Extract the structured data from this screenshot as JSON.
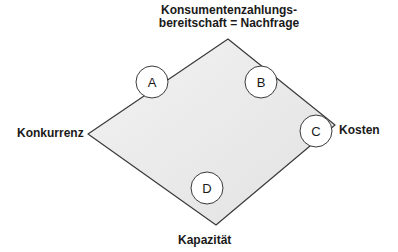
{
  "diagram": {
    "top_label_line1": "Konsumentenzahlungs-",
    "top_label_line2": "bereitschaft = Nachfrage",
    "left_label": "Konkurrenz",
    "right_label": "Kosten",
    "bottom_label": "Kapazität",
    "markers": [
      {
        "id": "A",
        "label": "A"
      },
      {
        "id": "B",
        "label": "B"
      },
      {
        "id": "C",
        "label": "C"
      },
      {
        "id": "D",
        "label": "D"
      }
    ],
    "colors": {
      "fill": "#ebebeb",
      "stroke": "#3a3a3a",
      "circle_fill": "#ffffff",
      "text": "#1a1a1a"
    }
  }
}
